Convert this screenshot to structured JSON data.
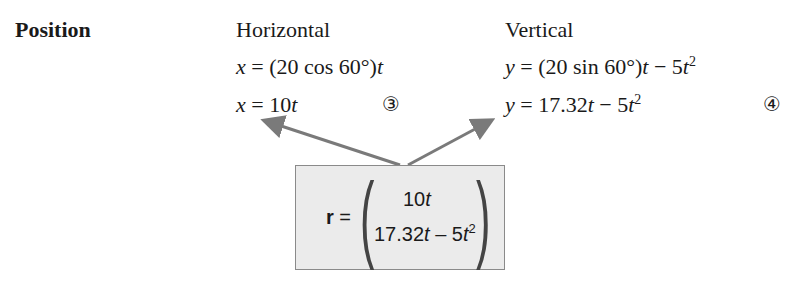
{
  "section": {
    "heading": "Position"
  },
  "columns": {
    "horizontal": {
      "title": "Horizontal",
      "eq1": {
        "lhs": "x",
        "rhs_pre": " = (20 cos 60°)",
        "rhs_var": "t"
      },
      "eq2": {
        "lhs": "x",
        "rhs_pre": " = 10",
        "rhs_var": "t"
      },
      "label": "③"
    },
    "vertical": {
      "title": "Vertical",
      "eq1": {
        "lhs": "y",
        "mid": " = (20 sin 60°)",
        "var1": "t",
        "minus": " − 5",
        "var2": "t",
        "exp": "2"
      },
      "eq2": {
        "lhs": "y",
        "mid": " = 17.32",
        "var1": "t",
        "minus": " − 5",
        "var2": "t",
        "exp": "2"
      },
      "label": "④"
    }
  },
  "vector_box": {
    "symbol": "r",
    "equals": "=",
    "row1_num": "10",
    "row1_var": "t",
    "row2_num": "17.32",
    "row2_var": "t",
    "row2_minus": " – 5",
    "row2_var2": "t",
    "row2_exp": "2",
    "colors": {
      "fill": "#ebebeb",
      "border": "#8a8a8a",
      "arrow": "#7a7a7a"
    }
  }
}
